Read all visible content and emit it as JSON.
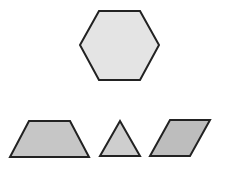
{
  "diagram": {
    "colors": {
      "stroke": "#222222",
      "hexagon_fill": "#e4e4e4",
      "trapezoid_fill": "#c6c6c6",
      "triangle_fill": "#cecece",
      "rhombus_fill": "#bdbdbd"
    },
    "shapes": [
      {
        "name": "hexagon",
        "points": "99,11 140,11 159,45 140,80 99,80 80,45"
      },
      {
        "name": "trapezoid",
        "points": "29,121 70,121 89,157 10,157"
      },
      {
        "name": "triangle",
        "points": "120,121 140,156 100,156"
      },
      {
        "name": "rhombus",
        "points": "170,120 210,120 190,156 150,156"
      }
    ]
  }
}
